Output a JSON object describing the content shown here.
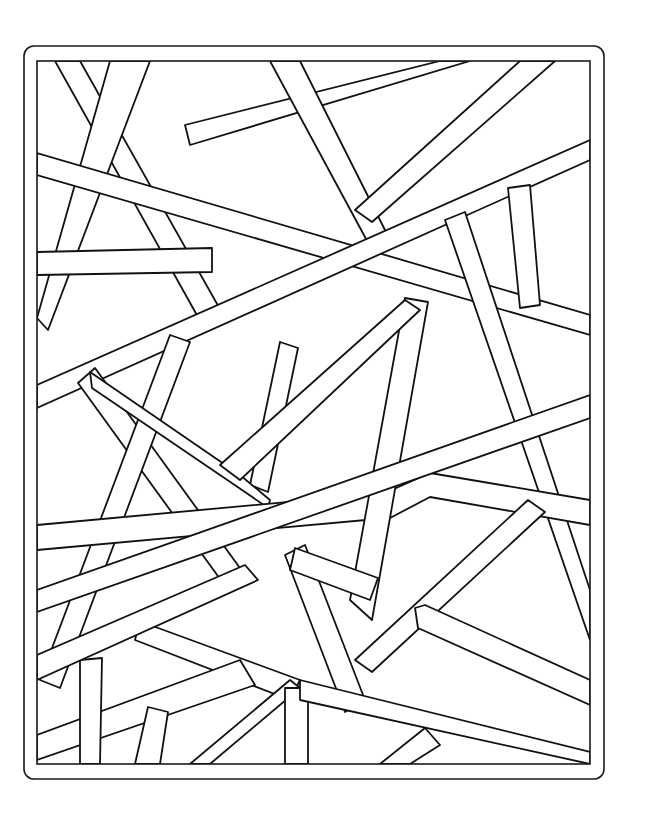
{
  "page": {
    "background": "#ffffff",
    "line_color": "#111111"
  },
  "frame": {
    "outer": {
      "x": 24,
      "y": 46,
      "w": 580,
      "h": 733,
      "radius": 10
    },
    "inner": {
      "x": 37,
      "y": 61,
      "w": 553,
      "h": 703
    }
  },
  "bars": [
    {
      "id": 1,
      "points": "55,61 80,61 225,318 203,326"
    },
    {
      "id": 2,
      "points": "110,61 150,61 48,330 37,318"
    },
    {
      "id": 3,
      "points": "185,125 440,61 470,61 190,145"
    },
    {
      "id": 4,
      "points": "270,61 300,61 390,240 372,250"
    },
    {
      "id": 5,
      "points": "355,210 520,61 555,61 372,222"
    },
    {
      "id": 6,
      "points": "37,153 590,315 590,335 37,175"
    },
    {
      "id": 7,
      "points": "37,252 212,248 212,272 37,275"
    },
    {
      "id": 8,
      "points": "37,385 590,140 590,160 37,408"
    },
    {
      "id": 9,
      "points": "508,188 530,185 540,305 520,308"
    },
    {
      "id": 10,
      "points": "445,220 465,212 590,590 590,640"
    },
    {
      "id": 11,
      "points": "78,383 95,368 245,575 228,590"
    },
    {
      "id": 12,
      "points": "40,680 170,335 190,342 60,688"
    },
    {
      "id": 13,
      "points": "250,485 280,342 298,348 268,492"
    },
    {
      "id": 14,
      "points": "90,372 240,475 270,500 268,508 245,492 92,388"
    },
    {
      "id": 15,
      "points": "37,525 385,493 388,518 37,550"
    },
    {
      "id": 16,
      "points": "385,493 430,473 590,500 590,525 430,497 390,518"
    },
    {
      "id": 17,
      "points": "350,600 405,298 428,302 372,620"
    },
    {
      "id": 18,
      "points": "220,465 405,300 420,310 240,480"
    },
    {
      "id": 19,
      "points": "37,590 590,395 590,418 37,612"
    },
    {
      "id": 20,
      "points": "285,555 305,545 365,700 345,712"
    },
    {
      "id": 21,
      "points": "295,548 378,578 370,600 290,570"
    },
    {
      "id": 22,
      "points": "355,660 528,500 545,512 372,672"
    },
    {
      "id": 23,
      "points": "415,608 425,605 590,680 590,705 418,628"
    },
    {
      "id": 24,
      "points": "140,620 150,625 300,680 290,700 135,640"
    },
    {
      "id": 25,
      "points": "37,735 240,660 255,685 37,760"
    },
    {
      "id": 26,
      "points": "80,660 102,658 100,764 80,764"
    },
    {
      "id": 27,
      "points": "135,764 148,707 168,712 160,764"
    },
    {
      "id": 28,
      "points": "190,764 290,680 300,688 210,764"
    },
    {
      "id": 29,
      "points": "285,688 308,688 308,764 285,764"
    },
    {
      "id": 30,
      "points": "380,764 425,728 440,745 410,764"
    },
    {
      "id": 31,
      "points": "37,655 245,565 258,580 37,680"
    },
    {
      "id": 32,
      "points": "300,680 590,752 590,764 300,700"
    }
  ]
}
